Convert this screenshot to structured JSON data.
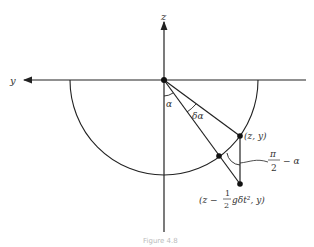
{
  "diagram": {
    "axes": {
      "horizontal_label": "y",
      "vertical_label": "z"
    },
    "angles": {
      "alpha": "α",
      "delta_alpha": "δα",
      "complement": {
        "numerator": "π",
        "denominator": "2",
        "suffix": "− α"
      }
    },
    "points": {
      "upper": "(z, y)",
      "lower": {
        "prefix": "(z −",
        "frac_num": "1",
        "frac_den": "2",
        "suffix": "gδt², y)"
      }
    },
    "caption": "Figure 4.8"
  }
}
